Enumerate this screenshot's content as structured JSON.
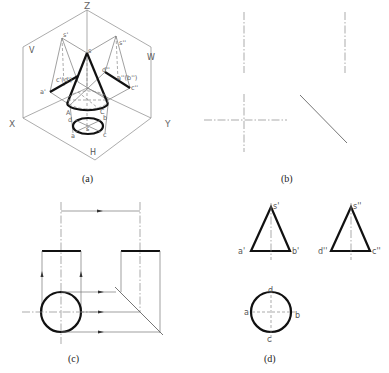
{
  "figure": {
    "panels": {
      "a": {
        "caption": "(a)",
        "axes": {
          "z": "Z",
          "x": "X",
          "y": "Y"
        },
        "planes": {
          "v": "V",
          "w": "W",
          "h": "H"
        },
        "labels": {
          "s_prime": "s'",
          "s_double_prime": "s''",
          "s_top": "s",
          "a_prime": "a'",
          "c_d_prime": "c'(d')",
          "d_double_prime": "d''",
          "a_b_double_prime": "a''(b'')",
          "c_double_prime": "c''",
          "A": "A",
          "C": "C",
          "s_h": "s",
          "a_h": "a",
          "b_h": "b",
          "c_h": "c",
          "d_h": "d"
        }
      },
      "b": {
        "caption": "(b)"
      },
      "c": {
        "caption": "(c)"
      },
      "d": {
        "caption": "(d)",
        "labels": {
          "s_prime": "s'",
          "a_prime": "a'",
          "b_prime": "b'",
          "s_double_prime": "s''",
          "d_double_prime": "d''",
          "c_double_prime": "c''",
          "d": "d",
          "a": "a",
          "b": "b",
          "c": "c"
        }
      }
    }
  }
}
